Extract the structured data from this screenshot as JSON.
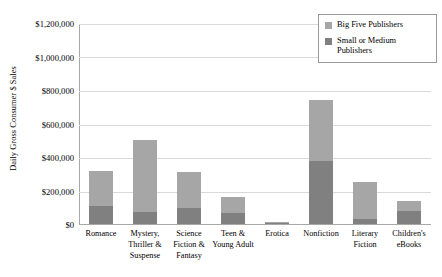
{
  "chart_data": {
    "type": "bar",
    "subtype": "stacked-vertical",
    "title": "",
    "xlabel": "",
    "ylabel": "Daily Gross Consumer $ Sales",
    "ylim": [
      0,
      1200000
    ],
    "ytick_step": 200000,
    "ytick_labels": [
      "$1,200,000",
      "$1,000,000",
      "$800,000",
      "$600,000",
      "$400,000",
      "$200,000",
      "$0"
    ],
    "ytick_values": [
      1200000,
      1000000,
      800000,
      600000,
      400000,
      200000,
      0
    ],
    "grid": true,
    "grid_axis": "y",
    "legend_position": "top-right",
    "categories": [
      "Romance",
      "Mystery, Thriller & Suspense",
      "Science Fiction & Fantasy",
      "Teen & Young Adult",
      "Erotica",
      "Nonfiction",
      "Literary Fiction",
      "Children's eBooks"
    ],
    "series": [
      {
        "name": "Small or Medium Publishers",
        "color": "#808080",
        "values": [
          115000,
          80000,
          100000,
          70000,
          10000,
          380000,
          35000,
          85000
        ]
      },
      {
        "name": "Big Five Publishers",
        "color": "#a6a6a6",
        "values": [
          210000,
          425000,
          215000,
          95000,
          8000,
          365000,
          220000,
          60000
        ]
      }
    ],
    "totals": [
      325000,
      505000,
      315000,
      165000,
      18000,
      745000,
      255000,
      145000
    ]
  },
  "legend": {
    "entries": [
      {
        "label": "Big Five Publishers",
        "color": "#a6a6a6"
      },
      {
        "label": "Small or Medium Publishers",
        "color": "#808080"
      }
    ]
  },
  "colors": {
    "big_five": "#a6a6a6",
    "small_medium": "#808080",
    "gridline": "#d9d9d9",
    "axis": "#a8a8a8",
    "background": "#ffffff",
    "text": "#000000"
  }
}
